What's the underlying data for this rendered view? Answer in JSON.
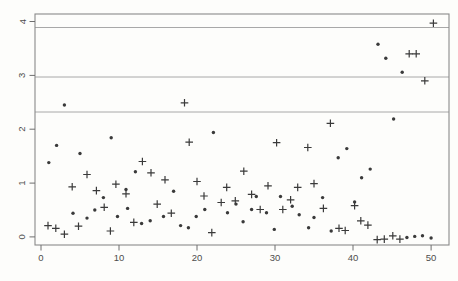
{
  "chart_data": {
    "type": "scatter",
    "title": "",
    "xlabel": "",
    "ylabel": "",
    "x_ticks": [
      0,
      10,
      20,
      30,
      40,
      50
    ],
    "y_ticks": [
      0,
      1,
      2,
      3,
      4
    ],
    "xlim": [
      -0.77,
      52.3
    ],
    "ylim": [
      -0.15,
      4.14
    ],
    "grid": false,
    "legend": "none",
    "hlines": [
      2.32,
      2.97,
      3.89
    ],
    "colors": {
      "background": "#fdfdfb",
      "axis": "#8a8a8a",
      "tick": "#6e6e6e",
      "tick_label": "#4d4d4d",
      "hline": "#a8a8a8",
      "marker": "#3a3a3a"
    },
    "series": [
      {
        "name": "filled-circle-series",
        "marker": "filled-circle",
        "color": "#3a3a3a",
        "points": [
          [
            1.0,
            1.38
          ],
          [
            2.0,
            1.7
          ],
          [
            3.0,
            2.45
          ],
          [
            4.1,
            0.44
          ],
          [
            5.0,
            1.55
          ],
          [
            5.9,
            0.35
          ],
          [
            6.9,
            0.5
          ],
          [
            8.0,
            0.73
          ],
          [
            9.0,
            1.84
          ],
          [
            9.8,
            0.38
          ],
          [
            10.9,
            0.88
          ],
          [
            11.1,
            0.53
          ],
          [
            12.1,
            1.21
          ],
          [
            12.9,
            0.25
          ],
          [
            14.0,
            0.3
          ],
          [
            15.7,
            0.38
          ],
          [
            17.0,
            0.85
          ],
          [
            17.9,
            0.21
          ],
          [
            18.9,
            0.17
          ],
          [
            19.9,
            0.38
          ],
          [
            21.0,
            0.51
          ],
          [
            22.1,
            1.94
          ],
          [
            23.9,
            0.45
          ],
          [
            25.0,
            0.61
          ],
          [
            25.9,
            0.28
          ],
          [
            27.0,
            0.51
          ],
          [
            27.6,
            0.75
          ],
          [
            28.9,
            0.45
          ],
          [
            29.9,
            0.14
          ],
          [
            30.7,
            0.75
          ],
          [
            32.2,
            0.57
          ],
          [
            33.1,
            0.41
          ],
          [
            34.3,
            0.17
          ],
          [
            35.0,
            0.36
          ],
          [
            36.1,
            0.73
          ],
          [
            37.2,
            0.11
          ],
          [
            38.1,
            1.47
          ],
          [
            39.2,
            1.64
          ],
          [
            40.2,
            0.65
          ],
          [
            41.1,
            1.1
          ],
          [
            42.2,
            1.26
          ],
          [
            43.2,
            3.58
          ],
          [
            44.2,
            3.32
          ],
          [
            45.2,
            2.19
          ],
          [
            46.3,
            3.06
          ],
          [
            46.9,
            -0.01
          ],
          [
            47.9,
            0.01
          ],
          [
            48.9,
            0.02
          ],
          [
            50.0,
            -0.02
          ]
        ]
      },
      {
        "name": "plus-sign-series",
        "marker": "plus",
        "color": "#3a3a3a",
        "points": [
          [
            0.9,
            0.21
          ],
          [
            1.9,
            0.16
          ],
          [
            3.0,
            0.05
          ],
          [
            4.0,
            0.93
          ],
          [
            4.8,
            0.2
          ],
          [
            5.9,
            1.16
          ],
          [
            7.1,
            0.86
          ],
          [
            8.1,
            0.55
          ],
          [
            8.9,
            0.11
          ],
          [
            9.6,
            0.98
          ],
          [
            10.9,
            0.8
          ],
          [
            11.9,
            0.27
          ],
          [
            13.0,
            1.4
          ],
          [
            14.1,
            1.19
          ],
          [
            14.9,
            0.61
          ],
          [
            15.9,
            1.06
          ],
          [
            16.7,
            0.44
          ],
          [
            18.4,
            2.49
          ],
          [
            19.0,
            1.76
          ],
          [
            20.0,
            1.03
          ],
          [
            20.9,
            0.76
          ],
          [
            21.9,
            0.08
          ],
          [
            23.1,
            0.64
          ],
          [
            23.8,
            0.92
          ],
          [
            24.9,
            0.67
          ],
          [
            26.0,
            1.22
          ],
          [
            27.0,
            0.79
          ],
          [
            28.1,
            0.51
          ],
          [
            29.1,
            0.95
          ],
          [
            30.2,
            1.75
          ],
          [
            31.0,
            0.51
          ],
          [
            32.0,
            0.69
          ],
          [
            32.9,
            0.92
          ],
          [
            34.2,
            1.66
          ],
          [
            35.0,
            0.99
          ],
          [
            36.2,
            0.53
          ],
          [
            37.1,
            2.11
          ],
          [
            38.2,
            0.16
          ],
          [
            39.0,
            0.12
          ],
          [
            40.2,
            0.58
          ],
          [
            41.0,
            0.3
          ],
          [
            41.9,
            0.22
          ],
          [
            43.1,
            -0.05
          ],
          [
            44.0,
            -0.04
          ],
          [
            45.1,
            0.02
          ],
          [
            46.0,
            -0.04
          ],
          [
            47.2,
            3.4
          ],
          [
            48.1,
            3.4
          ],
          [
            49.2,
            2.9
          ],
          [
            50.3,
            3.97
          ]
        ]
      }
    ]
  }
}
